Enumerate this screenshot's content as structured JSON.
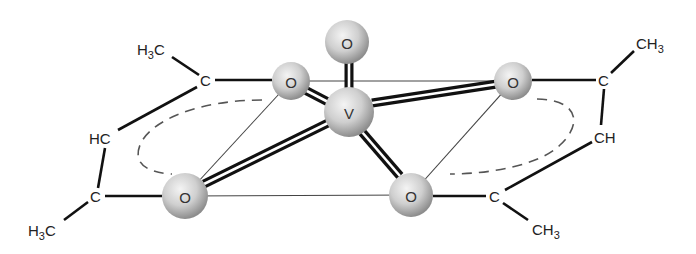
{
  "diagram": {
    "atoms": {
      "o_top": {
        "label": "O",
        "x": 347,
        "y": 42,
        "r": 22
      },
      "v_center": {
        "label": "V",
        "x": 349,
        "y": 112,
        "r": 25
      },
      "o_upper_left": {
        "label": "O",
        "x": 291,
        "y": 81,
        "r": 19
      },
      "o_upper_right": {
        "label": "O",
        "x": 513,
        "y": 81,
        "r": 19
      },
      "o_lower_left": {
        "label": "O",
        "x": 185,
        "y": 196,
        "r": 23
      },
      "o_lower_right": {
        "label": "O",
        "x": 411,
        "y": 195,
        "r": 22
      }
    },
    "left_ligand": {
      "c_top": "C",
      "methyl_top": {
        "main": "H",
        "sub": "3",
        "tail": "C"
      },
      "ch_middle": "HC",
      "c_bottom": "C",
      "methyl_bottom": {
        "main": "H",
        "sub": "3",
        "tail": "C"
      }
    },
    "right_ligand": {
      "c_top": "C",
      "methyl_top": {
        "main": "CH",
        "sub": "3"
      },
      "ch_middle": "CH",
      "c_bottom": "C",
      "methyl_bottom": {
        "main": "CH",
        "sub": "3"
      }
    },
    "colors": {
      "sphere_light": "#f2f2f2",
      "sphere_mid": "#c4c4c4",
      "sphere_dark": "#8a8a8a",
      "bond": "#111111",
      "dashed_ring": "#555555"
    }
  }
}
